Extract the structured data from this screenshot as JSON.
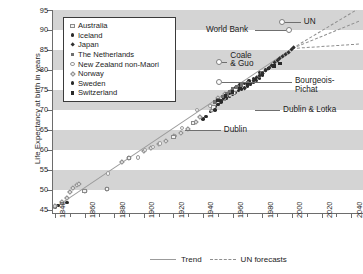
{
  "axes": {
    "ylabel": "Life Expectancy at birth in years",
    "yticks": [
      45,
      50,
      55,
      60,
      65,
      70,
      75,
      80,
      85,
      90,
      95
    ],
    "xticks": [
      1840,
      1860,
      1880,
      1900,
      1920,
      1940,
      1960,
      1980,
      2000,
      2020,
      2040
    ],
    "xlim": [
      1838,
      2048
    ],
    "ylim": [
      44.2,
      95
    ]
  },
  "legend": {
    "items": [
      {
        "label": "Australia",
        "marker": "open-square"
      },
      {
        "label": "Iceland",
        "marker": "filled-circle"
      },
      {
        "label": "Japan",
        "marker": "filled-diamond"
      },
      {
        "label": "The Netherlands",
        "marker": "filled-square-gray"
      },
      {
        "label": "New Zealand non-Maori",
        "marker": "open-circle"
      },
      {
        "label": "Norway",
        "marker": "open-diamond"
      },
      {
        "label": "Sweden",
        "marker": "filled-circle"
      },
      {
        "label": "Switzerland",
        "marker": "filled-square"
      }
    ]
  },
  "bottom_legend": {
    "trend_label": "Trend",
    "forecast_label": "UN forecasts"
  },
  "annotations": [
    {
      "name": "un",
      "label": "UN",
      "value": 92.0,
      "year": 2000
    },
    {
      "name": "world-bank",
      "label": "World Bank",
      "value": 90.0,
      "year": 1990
    },
    {
      "name": "coale-guo",
      "label": "Coale\n& Guo",
      "value": 82.0,
      "year": 1950
    },
    {
      "name": "bourgeois-pichat",
      "label": "Bourgeois-\nPichat",
      "value": 77.0,
      "year": 1950
    },
    {
      "name": "dublin-lotka",
      "label": "Dublin & Lotka",
      "value": 70.0,
      "year": 1936
    },
    {
      "name": "dublin",
      "label": "Dublin",
      "value": 65.0,
      "year": 1928
    }
  ],
  "chart_data": {
    "type": "scatter",
    "title": "",
    "xlabel": "",
    "ylabel": "Life Expectancy at birth in years",
    "xlim": [
      1838,
      2048
    ],
    "ylim": [
      44.2,
      95
    ],
    "grid": "horizontal-bands-every-10-years",
    "legend_position": "upper-left",
    "trend": {
      "label": "Trend",
      "style": "solid",
      "x": [
        1840,
        2000
      ],
      "y": [
        45.7,
        85.5
      ],
      "slope_per_year": 0.249
    },
    "un_forecasts": {
      "label": "UN forecasts",
      "style": "dashed",
      "origin": {
        "x": 2000,
        "y": 85.5
      },
      "lines": [
        {
          "name": "high",
          "x": [
            2000,
            2045
          ],
          "y": [
            85.5,
            95.5
          ]
        },
        {
          "name": "medium",
          "x": [
            2000,
            2045
          ],
          "y": [
            85.5,
            92.3
          ]
        },
        {
          "name": "low",
          "x": [
            2000,
            2045
          ],
          "y": [
            85.5,
            86.6
          ]
        }
      ]
    },
    "asserted_ceilings": [
      {
        "label": "Dublin",
        "value": 65.0,
        "asserted_year": 1928
      },
      {
        "label": "Dublin & Lotka",
        "value": 70.0,
        "asserted_year": 1936
      },
      {
        "label": "Bourgeois-Pichat",
        "value": 77.0,
        "asserted_year": 1952
      },
      {
        "label": "Coale & Guo",
        "value": 82.0,
        "asserted_year": 1952
      },
      {
        "label": "World Bank",
        "value": 90.0,
        "asserted_year": 1990
      },
      {
        "label": "UN",
        "value": 92.0,
        "asserted_year": 1999
      }
    ],
    "series": [
      {
        "name": "Sweden",
        "marker": "filled-circle",
        "points": [
          [
            1840,
            45.7
          ],
          [
            1842,
            46.0
          ],
          [
            1845,
            46.5
          ],
          [
            1848,
            46.9
          ],
          [
            1940,
            67.7
          ],
          [
            1942,
            68.3
          ],
          [
            1945,
            69.6
          ],
          [
            1948,
            70.8
          ],
          [
            1950,
            71.6
          ],
          [
            1952,
            72.0
          ],
          [
            1954,
            72.6
          ],
          [
            1956,
            73.0
          ],
          [
            1958,
            73.5
          ],
          [
            1960,
            74.0
          ],
          [
            1962,
            74.3
          ],
          [
            1964,
            74.9
          ],
          [
            1966,
            75.2
          ],
          [
            1968,
            75.6
          ],
          [
            1970,
            76.0
          ],
          [
            1972,
            76.4
          ],
          [
            1974,
            77.0
          ],
          [
            1976,
            77.4
          ],
          [
            1978,
            78.0
          ],
          [
            1980,
            78.7
          ]
        ]
      },
      {
        "name": "Norway",
        "marker": "open-diamond",
        "points": [
          [
            1840,
            46.0
          ],
          [
            1845,
            47.0
          ],
          [
            1848,
            48.0
          ],
          [
            1850,
            49.5
          ],
          [
            1852,
            50.6
          ],
          [
            1855,
            51.3
          ],
          [
            1856,
            51.4
          ],
          [
            1860,
            49.7
          ],
          [
            1875,
            50.3
          ],
          [
            1885,
            57.1
          ],
          [
            1890,
            58.0
          ],
          [
            1900,
            59.8
          ],
          [
            1905,
            60.6
          ],
          [
            1910,
            61.5
          ],
          [
            1915,
            62.3
          ],
          [
            1920,
            63.4
          ],
          [
            1925,
            64.2
          ],
          [
            1930,
            65.3
          ],
          [
            1935,
            67.0
          ],
          [
            1938,
            68.2
          ],
          [
            1946,
            70.0
          ],
          [
            1950,
            73.0
          ],
          [
            1955,
            74.0
          ]
        ]
      },
      {
        "name": "New Zealand non-Maori",
        "marker": "open-circle",
        "points": [
          [
            1876,
            54.1
          ],
          [
            1896,
            58.1
          ],
          [
            1901,
            59.9
          ],
          [
            1906,
            60.7
          ],
          [
            1911,
            61.6
          ],
          [
            1921,
            63.5
          ],
          [
            1926,
            65.4
          ],
          [
            1936,
            69.9
          ],
          [
            1945,
            71.0
          ],
          [
            1950,
            72.0
          ],
          [
            1955,
            73.2
          ],
          [
            1958,
            73.8
          ]
        ]
      },
      {
        "name": "Australia",
        "marker": "open-square",
        "points": [
          [
            1860,
            49.7
          ],
          [
            1875,
            50.3
          ],
          [
            1890,
            58.0
          ],
          [
            1920,
            63.3
          ],
          [
            1933,
            66.8
          ],
          [
            1947,
            70.6
          ],
          [
            1954,
            72.8
          ],
          [
            1961,
            74.2
          ]
        ]
      },
      {
        "name": "Iceland",
        "marker": "filled-circle",
        "points": [
          [
            1948,
            70.0
          ],
          [
            1950,
            71.4
          ],
          [
            1952,
            72.2
          ],
          [
            1954,
            73.0
          ],
          [
            1958,
            74.1
          ],
          [
            1960,
            75.2
          ],
          [
            1962,
            75.6
          ],
          [
            1965,
            76.2
          ],
          [
            1968,
            76.6
          ],
          [
            1971,
            77.2
          ],
          [
            1974,
            77.9
          ],
          [
            1978,
            79.4
          ],
          [
            1982,
            80.0
          ],
          [
            1985,
            80.6
          ]
        ]
      },
      {
        "name": "The Netherlands",
        "marker": "filled-square-gray",
        "points": [
          [
            1948,
            72.0
          ],
          [
            1950,
            72.6
          ],
          [
            1953,
            73.4
          ],
          [
            1956,
            74.0
          ],
          [
            1958,
            74.6
          ],
          [
            1960,
            75.3
          ],
          [
            1963,
            75.8
          ],
          [
            1966,
            76.3
          ],
          [
            1970,
            76.7
          ],
          [
            1974,
            77.3
          ],
          [
            1978,
            78.4
          ],
          [
            1980,
            79.2
          ]
        ]
      },
      {
        "name": "Switzerland",
        "marker": "filled-square",
        "points": [
          [
            1950,
            72.4
          ],
          [
            1955,
            73.5
          ],
          [
            1960,
            74.5
          ],
          [
            1965,
            75.4
          ],
          [
            1970,
            76.2
          ],
          [
            1975,
            77.6
          ],
          [
            1980,
            79.0
          ],
          [
            1984,
            80.3
          ],
          [
            1988,
            81.0
          ],
          [
            1992,
            81.6
          ]
        ]
      },
      {
        "name": "Japan",
        "marker": "filled-diamond",
        "points": [
          [
            1968,
            75.3
          ],
          [
            1970,
            76.0
          ],
          [
            1972,
            76.7
          ],
          [
            1974,
            77.4
          ],
          [
            1976,
            78.0
          ],
          [
            1978,
            78.6
          ],
          [
            1980,
            79.2
          ],
          [
            1982,
            79.8
          ],
          [
            1984,
            80.4
          ],
          [
            1986,
            81.2
          ],
          [
            1988,
            81.8
          ],
          [
            1990,
            82.4
          ],
          [
            1992,
            82.9
          ],
          [
            1994,
            83.3
          ],
          [
            1996,
            83.8
          ],
          [
            1998,
            84.3
          ],
          [
            2000,
            85.2
          ],
          [
            2001,
            85.5
          ]
        ]
      }
    ]
  }
}
